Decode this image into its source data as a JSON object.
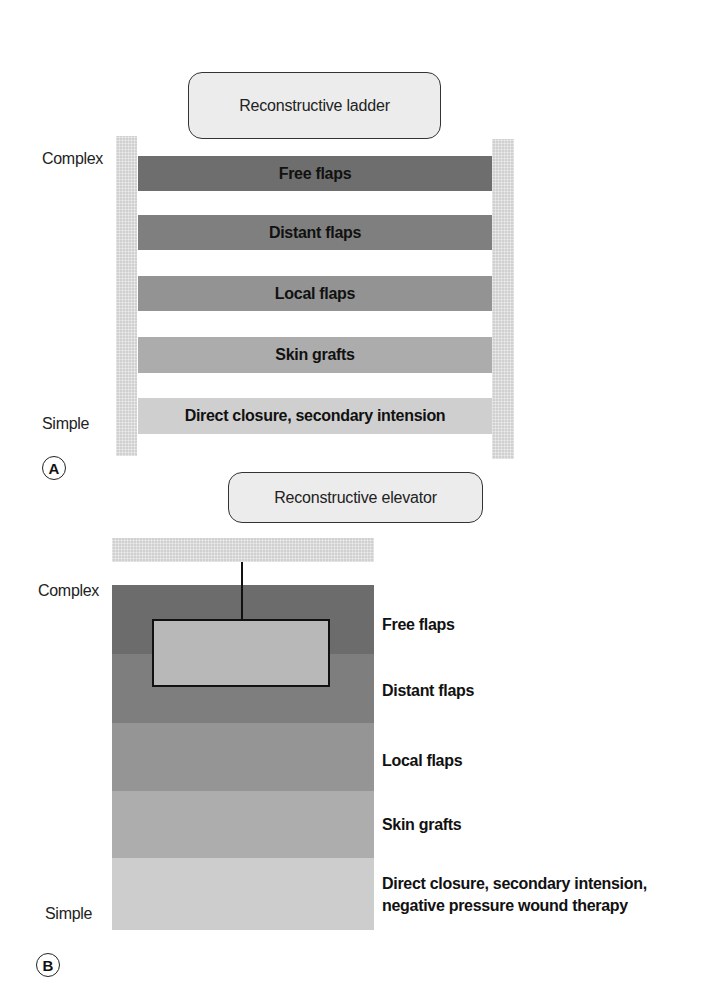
{
  "panel_a": {
    "title": "Reconstructive ladder",
    "label": "A",
    "axis_top": "Complex",
    "axis_bottom": "Simple",
    "rungs": [
      {
        "label": "Free flaps",
        "color": "#6e6e6e"
      },
      {
        "label": "Distant flaps",
        "color": "#7f7f7f"
      },
      {
        "label": "Local flaps",
        "color": "#939393"
      },
      {
        "label": "Skin grafts",
        "color": "#acacac"
      },
      {
        "label": "Direct closure, secondary intension",
        "color": "#cfcfcf"
      }
    ],
    "rail_color": "#d0d0d0"
  },
  "panel_b": {
    "title": "Reconstructive elevator",
    "label": "B",
    "axis_top": "Complex",
    "axis_bottom": "Simple",
    "levels": [
      {
        "label": "Free flaps",
        "color": "#6c6c6c"
      },
      {
        "label": "Distant flaps",
        "color": "#7e7e7e"
      },
      {
        "label": "Local flaps",
        "color": "#959595"
      },
      {
        "label": "Skin grafts",
        "color": "#adadad"
      },
      {
        "label_line1": "Direct closure, secondary intension,",
        "label_line2": "negative pressure wound therapy",
        "color": "#cdcdcd"
      }
    ],
    "elevator_car_color": "#b8b8b8",
    "shaft_top_color": "#d4d4d4"
  }
}
